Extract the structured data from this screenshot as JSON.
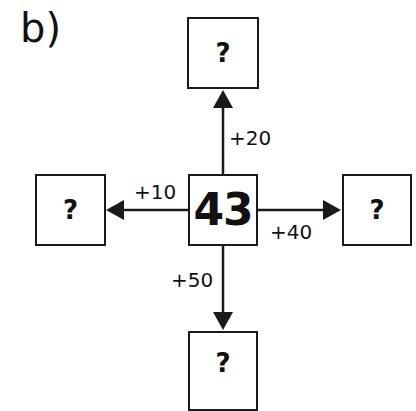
{
  "label": "b)",
  "center": {
    "value": "43"
  },
  "nodes": {
    "top": {
      "value": "?",
      "operation": "+20"
    },
    "left": {
      "value": "?",
      "operation": "+10"
    },
    "right": {
      "value": "?",
      "operation": "+40"
    },
    "bottom": {
      "value": "?",
      "operation": "+50"
    }
  },
  "colors": {
    "stroke": "#1a1a1a",
    "background": "#ffffff"
  }
}
